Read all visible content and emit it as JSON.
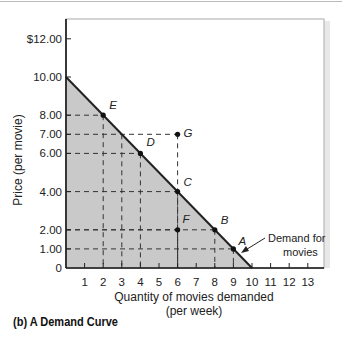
{
  "chart_data": {
    "type": "line",
    "title": "",
    "caption": "(b) A Demand Curve",
    "xlabel": "Quantity of movies demanded",
    "xlabel_sub": "(per week)",
    "ylabel": "Price (per movie)",
    "xlim": [
      0,
      13
    ],
    "ylim": [
      0,
      12
    ],
    "x_ticks": [
      "1",
      "2",
      "3",
      "4",
      "5",
      "6",
      "7",
      "8",
      "9",
      "10",
      "11",
      "12",
      "13"
    ],
    "y_ticks": [
      {
        "value": 12,
        "label": "$12.00"
      },
      {
        "value": 10,
        "label": "10.00"
      },
      {
        "value": 8,
        "label": "8.00"
      },
      {
        "value": 7,
        "label": "7.00"
      },
      {
        "value": 6,
        "label": "6.00"
      },
      {
        "value": 4,
        "label": "4.00"
      },
      {
        "value": 2,
        "label": "2.00"
      },
      {
        "value": 1,
        "label": "1.00"
      },
      {
        "value": 0,
        "label": "0"
      }
    ],
    "series": [
      {
        "name": "Demand for movies",
        "x": [
          0,
          10
        ],
        "y": [
          10,
          0
        ]
      }
    ],
    "points": [
      {
        "label": "A",
        "x": 9,
        "y": 1
      },
      {
        "label": "B",
        "x": 8,
        "y": 2
      },
      {
        "label": "C",
        "x": 6,
        "y": 4
      },
      {
        "label": "D",
        "x": 4,
        "y": 6
      },
      {
        "label": "E",
        "x": 2,
        "y": 8
      },
      {
        "label": "F",
        "x": 6,
        "y": 2
      },
      {
        "label": "G",
        "x": 6,
        "y": 7
      }
    ],
    "annotations": [
      {
        "text": "Demand for",
        "line2": "movies",
        "points_to": "demand curve near A"
      }
    ],
    "shaded_region": "area under demand curve (consumer spending region)",
    "grid": false,
    "colors": {
      "shade": "#c9c9c9",
      "line": "#222222",
      "frame": "#aaaaaa"
    }
  }
}
